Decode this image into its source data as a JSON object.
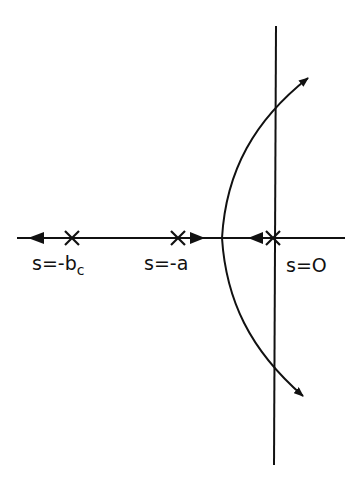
{
  "diagram": {
    "type": "root-locus",
    "labels": {
      "pole_bc": "s=-b",
      "pole_bc_sub": "c",
      "pole_a": "s=-a",
      "pole_0": "s=O"
    },
    "poles": [
      {
        "name": "s=-b_c",
        "x": 72
      },
      {
        "name": "s=-a",
        "x": 178
      },
      {
        "name": "s=0",
        "x": 273
      }
    ],
    "colors": {
      "ink": "#111111",
      "background": "#ffffff"
    }
  }
}
